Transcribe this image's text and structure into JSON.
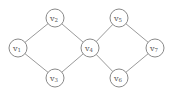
{
  "diagram": {
    "type": "graph",
    "node_radius": 9,
    "nodes": [
      {
        "id": "v1",
        "label": "v",
        "sub": "1",
        "x": 18,
        "y": 48
      },
      {
        "id": "v2",
        "label": "v",
        "sub": "2",
        "x": 55,
        "y": 18
      },
      {
        "id": "v3",
        "label": "v",
        "sub": "3",
        "x": 55,
        "y": 78
      },
      {
        "id": "v4",
        "label": "v",
        "sub": "4",
        "x": 90,
        "y": 48
      },
      {
        "id": "v5",
        "label": "v",
        "sub": "5",
        "x": 119,
        "y": 18
      },
      {
        "id": "v6",
        "label": "v",
        "sub": "6",
        "x": 119,
        "y": 78
      },
      {
        "id": "v7",
        "label": "v",
        "sub": "7",
        "x": 155,
        "y": 48
      }
    ],
    "edges": [
      [
        "v1",
        "v2"
      ],
      [
        "v1",
        "v3"
      ],
      [
        "v2",
        "v4"
      ],
      [
        "v3",
        "v4"
      ],
      [
        "v4",
        "v5"
      ],
      [
        "v4",
        "v6"
      ],
      [
        "v5",
        "v7"
      ],
      [
        "v6",
        "v7"
      ]
    ]
  }
}
